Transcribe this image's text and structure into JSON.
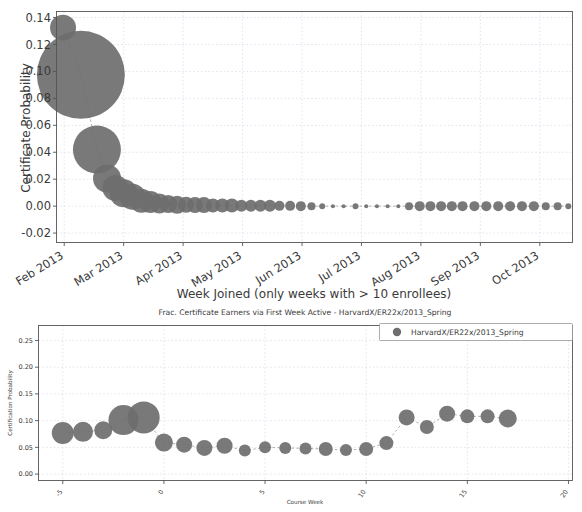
{
  "figure": {
    "background_color": "#ffffff",
    "marker_color": "#6e6e6e",
    "grid_color": "#d9d9ea",
    "frame_color": "#555555",
    "connector_color": "#9a9a9a"
  },
  "chart_data": [
    {
      "id": "top-chart",
      "type": "scatter",
      "title": "",
      "xlabel": "Week Joined (only weeks with > 10 enrollees)",
      "ylabel": "Certificate Probability",
      "xtick_labels": [
        "Feb 2013",
        "Mar 2013",
        "Apr 2013",
        "May 2013",
        "Jun 2013",
        "Jul 2013",
        "Aug 2013",
        "Sep 2013",
        "Oct 2013"
      ],
      "xtick_positions": [
        0.0,
        1.0,
        2.0,
        3.0,
        4.0,
        5.0,
        6.0,
        7.0,
        8.0
      ],
      "ytick_labels": [
        "-0.02",
        "0.00",
        "0.02",
        "0.04",
        "0.06",
        "0.08",
        "0.10",
        "0.12",
        "0.14"
      ],
      "ytick_values": [
        -0.02,
        0.0,
        0.02,
        0.04,
        0.06,
        0.08,
        0.1,
        0.12,
        0.14
      ],
      "xlim": [
        -0.13,
        8.55
      ],
      "ylim": [
        -0.027,
        0.1445
      ],
      "grid": true,
      "legend": null,
      "marker_size_meaning": "bubble area proportional to number of enrollees in that week",
      "points": [
        {
          "x": -0.02,
          "y": 0.1325,
          "size": 13
        },
        {
          "x": 0.28,
          "y": 0.0975,
          "size": 44
        },
        {
          "x": 0.55,
          "y": 0.042,
          "size": 24
        },
        {
          "x": 0.72,
          "y": 0.0205,
          "size": 14
        },
        {
          "x": 0.86,
          "y": 0.0135,
          "size": 13
        },
        {
          "x": 1.0,
          "y": 0.0095,
          "size": 14
        },
        {
          "x": 1.15,
          "y": 0.007,
          "size": 13
        },
        {
          "x": 1.3,
          "y": 0.004,
          "size": 12
        },
        {
          "x": 1.45,
          "y": 0.003,
          "size": 11
        },
        {
          "x": 1.6,
          "y": 0.002,
          "size": 10
        },
        {
          "x": 1.75,
          "y": 0.0015,
          "size": 9
        },
        {
          "x": 1.9,
          "y": 0.001,
          "size": 9
        },
        {
          "x": 2.05,
          "y": 0.001,
          "size": 8
        },
        {
          "x": 2.2,
          "y": 0.0008,
          "size": 8
        },
        {
          "x": 2.35,
          "y": 0.0008,
          "size": 8
        },
        {
          "x": 2.5,
          "y": 0.0005,
          "size": 7
        },
        {
          "x": 2.66,
          "y": 0.0005,
          "size": 7
        },
        {
          "x": 2.82,
          "y": 0.0005,
          "size": 7
        },
        {
          "x": 2.98,
          "y": 0.0003,
          "size": 6
        },
        {
          "x": 3.14,
          "y": 0.0003,
          "size": 6
        },
        {
          "x": 3.3,
          "y": 0.0003,
          "size": 6
        },
        {
          "x": 3.46,
          "y": 0.0002,
          "size": 6
        },
        {
          "x": 3.62,
          "y": 0.0002,
          "size": 5
        },
        {
          "x": 3.8,
          "y": 0.0002,
          "size": 5
        },
        {
          "x": 3.98,
          "y": 0.0,
          "size": 5
        },
        {
          "x": 4.16,
          "y": 0.0,
          "size": 4
        },
        {
          "x": 4.34,
          "y": 0.0,
          "size": 3
        },
        {
          "x": 4.52,
          "y": 0.0,
          "size": 2
        },
        {
          "x": 4.7,
          "y": 0.0,
          "size": 2
        },
        {
          "x": 4.9,
          "y": 0.0,
          "size": 3
        },
        {
          "x": 5.08,
          "y": 0.0,
          "size": 2
        },
        {
          "x": 5.26,
          "y": 0.0,
          "size": 2
        },
        {
          "x": 5.44,
          "y": 0.0,
          "size": 2
        },
        {
          "x": 5.62,
          "y": 0.0,
          "size": 2
        },
        {
          "x": 5.8,
          "y": 0.0,
          "size": 4
        },
        {
          "x": 5.98,
          "y": 0.0,
          "size": 5
        },
        {
          "x": 6.16,
          "y": 0.0,
          "size": 5
        },
        {
          "x": 6.34,
          "y": 0.0,
          "size": 5
        },
        {
          "x": 6.52,
          "y": 0.0,
          "size": 5
        },
        {
          "x": 6.7,
          "y": 0.0,
          "size": 5
        },
        {
          "x": 6.9,
          "y": 0.0,
          "size": 5
        },
        {
          "x": 7.1,
          "y": 0.0,
          "size": 5
        },
        {
          "x": 7.3,
          "y": 0.0,
          "size": 5
        },
        {
          "x": 7.5,
          "y": 0.0,
          "size": 5
        },
        {
          "x": 7.7,
          "y": 0.0,
          "size": 5
        },
        {
          "x": 7.9,
          "y": 0.0,
          "size": 5
        },
        {
          "x": 8.1,
          "y": 0.0,
          "size": 4
        },
        {
          "x": 8.3,
          "y": 0.0,
          "size": 4
        },
        {
          "x": 8.48,
          "y": 0.0,
          "size": 3
        }
      ]
    },
    {
      "id": "bottom-chart",
      "type": "scatter",
      "title": "Frac. Certificate Earners via First Week Active - HarvardX/ER22x/2013_Spring",
      "xlabel": "Course Week",
      "ylabel": "Certification Probability",
      "xtick_labels": [
        "-5",
        "0",
        "5",
        "10",
        "15",
        "20"
      ],
      "xtick_values": [
        -5,
        0,
        5,
        10,
        15,
        20
      ],
      "ytick_labels": [
        "0.00",
        "0.05",
        "0.10",
        "0.15",
        "0.20",
        "0.25"
      ],
      "ytick_values": [
        0.0,
        0.05,
        0.1,
        0.15,
        0.2,
        0.25
      ],
      "xlim": [
        -6.2,
        20.2
      ],
      "ylim": [
        -0.012,
        0.278
      ],
      "grid": true,
      "legend": {
        "position": "upper right",
        "entries": [
          {
            "label": "HarvardX/ER22x/2013_Spring",
            "marker": "circle",
            "color": "#6e6e6e"
          }
        ]
      },
      "marker_size_meaning": "bubble area proportional to number of users first active that week",
      "series": [
        {
          "name": "HarvardX/ER22x/2013_Spring",
          "points": [
            {
              "x": -5.0,
              "y": 0.077,
              "size": 11
            },
            {
              "x": -4.0,
              "y": 0.079,
              "size": 10
            },
            {
              "x": -3.0,
              "y": 0.082,
              "size": 9
            },
            {
              "x": -2.0,
              "y": 0.101,
              "size": 15
            },
            {
              "x": -1.0,
              "y": 0.106,
              "size": 16
            },
            {
              "x": 0.0,
              "y": 0.059,
              "size": 9
            },
            {
              "x": 1.0,
              "y": 0.055,
              "size": 8
            },
            {
              "x": 2.0,
              "y": 0.049,
              "size": 8
            },
            {
              "x": 3.0,
              "y": 0.053,
              "size": 8
            },
            {
              "x": 4.0,
              "y": 0.044,
              "size": 6
            },
            {
              "x": 5.0,
              "y": 0.05,
              "size": 6
            },
            {
              "x": 6.0,
              "y": 0.049,
              "size": 6
            },
            {
              "x": 7.0,
              "y": 0.048,
              "size": 6
            },
            {
              "x": 8.0,
              "y": 0.047,
              "size": 7
            },
            {
              "x": 9.0,
              "y": 0.045,
              "size": 6
            },
            {
              "x": 10.0,
              "y": 0.047,
              "size": 7
            },
            {
              "x": 11.0,
              "y": 0.058,
              "size": 7
            },
            {
              "x": 12.0,
              "y": 0.106,
              "size": 8
            },
            {
              "x": 13.0,
              "y": 0.088,
              "size": 7
            },
            {
              "x": 14.0,
              "y": 0.113,
              "size": 8
            },
            {
              "x": 15.0,
              "y": 0.108,
              "size": 7
            },
            {
              "x": 16.0,
              "y": 0.108,
              "size": 7
            },
            {
              "x": 17.0,
              "y": 0.104,
              "size": 9
            }
          ]
        }
      ]
    }
  ]
}
